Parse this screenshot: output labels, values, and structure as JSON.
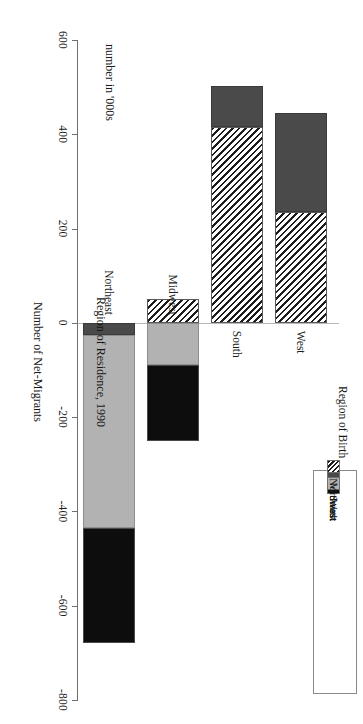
{
  "figure": {
    "unit_label": "number in '000s",
    "value_axis_title": "Number of Net-Migrants",
    "category_axis_title": "Region of Residence, 1990"
  },
  "legend": {
    "title": "Region of Birth",
    "items": [
      {
        "label": "West",
        "key": "west",
        "swatch": "solid-black",
        "color": "#0d0d0d"
      },
      {
        "label": "South",
        "key": "south",
        "swatch": "solid-lightgray",
        "color": "#b2b2b2"
      },
      {
        "label": "Midwest",
        "key": "midwest",
        "swatch": "solid-darkgray",
        "color": "#4a4a4a"
      },
      {
        "label": "Northeast",
        "key": "northeast",
        "swatch": "diagonal-hatch",
        "color": "#1c1c1c"
      }
    ]
  },
  "axis": {
    "ticks": [
      600,
      400,
      200,
      0,
      -200,
      -400,
      -600,
      -800
    ],
    "tick_labels": [
      "600",
      "400",
      "200",
      "0",
      "-200",
      "-400",
      "-600",
      "-800"
    ],
    "min": -800,
    "max": 600
  },
  "categories": [
    "West",
    "South",
    "Midwest",
    "Northeast"
  ],
  "chart_data": {
    "type": "bar",
    "orientation": "horizontal-stacked",
    "title": "Region of Residence, 1990",
    "xlabel": "Number of Net-Migrants",
    "ylabel": "Region of Residence, 1990",
    "unit": "number in '000s",
    "xlim": [
      -800,
      600
    ],
    "grid": false,
    "legend_position": "top-right",
    "legend_title": "Region of Birth",
    "categories": [
      "West",
      "South",
      "Midwest",
      "Northeast"
    ],
    "series": [
      {
        "name": "Northeast",
        "values": [
          235,
          415,
          50,
          0
        ]
      },
      {
        "name": "Midwest",
        "values": [
          210,
          88,
          0,
          -25
        ]
      },
      {
        "name": "South",
        "values": [
          0,
          0,
          -90,
          -410
        ]
      },
      {
        "name": "West",
        "values": [
          0,
          0,
          -160,
          -245
        ]
      }
    ],
    "totals": [
      445,
      503,
      -200,
      -680
    ]
  }
}
